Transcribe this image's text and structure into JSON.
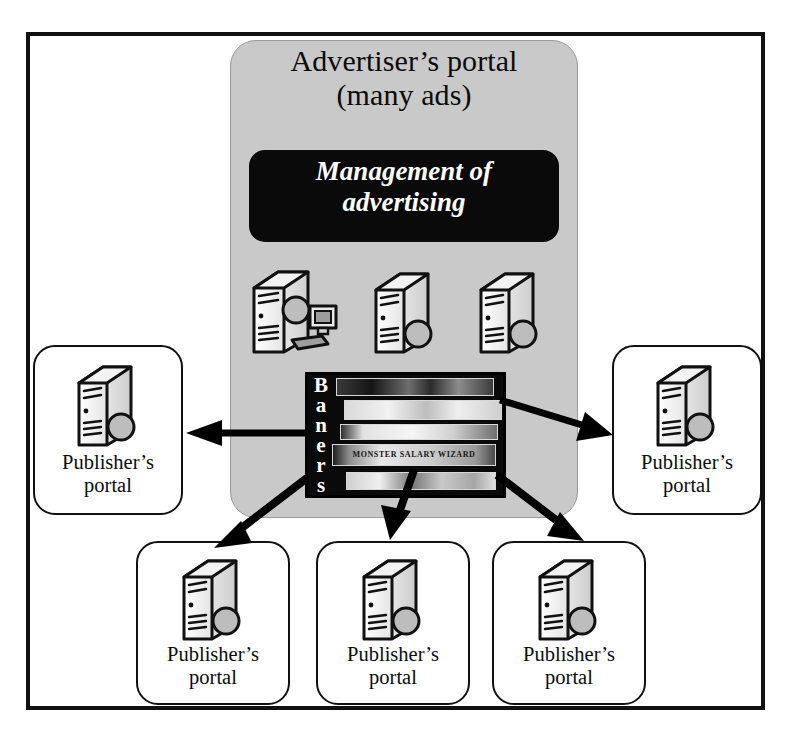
{
  "diagram": {
    "frame": {
      "name": "outer-frame"
    },
    "advertiser": {
      "title_line1": "Advertiser’s portal",
      "title_line2": "(many ads)",
      "management_line1": "Management of",
      "management_line2": "advertising",
      "servers": [
        {
          "name": "server-with-workstation",
          "has_monitor": true
        },
        {
          "name": "server-2",
          "has_monitor": false
        },
        {
          "name": "server-3",
          "has_monitor": false
        }
      ],
      "banners": {
        "label_letters": [
          "B",
          "a",
          "n",
          "e",
          "r",
          "s"
        ],
        "label_text": "Baners",
        "strip_count": 5,
        "strip_text": "MONSTER SALARY WIZARD"
      }
    },
    "publishers": [
      {
        "id": "publisher-left",
        "label_line1": "Publisher’s",
        "label_line2": "portal"
      },
      {
        "id": "publisher-right",
        "label_line1": "Publisher’s",
        "label_line2": "portal"
      },
      {
        "id": "publisher-bottom-1",
        "label_line1": "Publisher’s",
        "label_line2": "portal"
      },
      {
        "id": "publisher-bottom-2",
        "label_line1": "Publisher’s",
        "label_line2": "portal"
      },
      {
        "id": "publisher-bottom-3",
        "label_line1": "Publisher’s",
        "label_line2": "portal"
      }
    ],
    "arrows": [
      {
        "name": "arrow-to-publisher-left",
        "from": "banners",
        "to": "publisher-left"
      },
      {
        "name": "arrow-to-publisher-right",
        "from": "banners",
        "to": "publisher-right"
      },
      {
        "name": "arrow-to-publisher-bottom-1",
        "from": "banners",
        "to": "publisher-bottom-1"
      },
      {
        "name": "arrow-to-publisher-bottom-2",
        "from": "banners",
        "to": "publisher-bottom-2"
      },
      {
        "name": "arrow-to-publisher-bottom-3",
        "from": "banners",
        "to": "publisher-bottom-3"
      }
    ],
    "colors": {
      "panel_gray": "#c9c9c9",
      "box_black": "#0a0a0a",
      "frame_black": "#111111",
      "page_white": "#ffffff"
    }
  }
}
